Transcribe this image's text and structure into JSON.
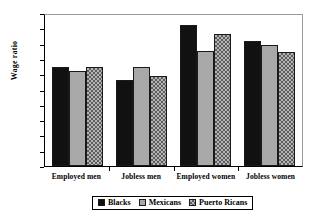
{
  "chart_data": {
    "type": "bar",
    "title": "",
    "xlabel": "",
    "ylabel": "Wage ratio",
    "ylim": [
      0,
      1
    ],
    "ytick_labels": [
      "1",
      "0.9",
      "0.8",
      "0.7",
      "0.6",
      "0.5",
      "0.4",
      "0.3",
      "0.2",
      "0.1",
      "0"
    ],
    "ytick_values": [
      1,
      0.9,
      0.8,
      0.7,
      0.6,
      0.5,
      0.4,
      0.3,
      0.2,
      0.1,
      0
    ],
    "grid": false,
    "legend_position": "bottom",
    "categories": [
      "Employed men",
      "Jobless men",
      "Employed women",
      "Jobless women"
    ],
    "series": [
      {
        "name": "Blacks",
        "values": [
          0.645,
          0.56,
          0.92,
          0.82
        ],
        "color": "#111111",
        "pattern": "solid"
      },
      {
        "name": "Mexicans",
        "values": [
          0.62,
          0.645,
          0.755,
          0.79
        ],
        "color": "#a8a8a8",
        "pattern": "solid-light"
      },
      {
        "name": "Puerto Ricans",
        "values": [
          0.645,
          0.59,
          0.86,
          0.745
        ],
        "color": "#b4b4b4",
        "pattern": "checker"
      }
    ]
  }
}
